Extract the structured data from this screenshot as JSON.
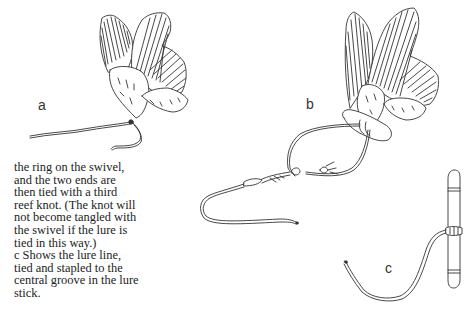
{
  "figure": {
    "panels": [
      {
        "id": "a",
        "label": "a",
        "description": "pair of wings tied together with lure line attached"
      },
      {
        "id": "b",
        "label": "b",
        "description": "wings tied to meat with line looped through swivel and reef knots"
      },
      {
        "id": "c",
        "label": "c",
        "description": "lure line tied and stapled to central groove of lure stick"
      }
    ]
  },
  "caption": {
    "lines": [
      "the ring on the swivel,",
      "and the two ends are",
      "then tied with a third",
      "reef knot. (The knot will",
      "not become tangled with",
      "the swivel if the lure is",
      "tied in this way.)",
      "c  Shows the lure line,",
      "tied and stapled to the",
      "central groove in the lure",
      "stick."
    ]
  },
  "colors": {
    "ink": "#333333",
    "paper": "#ffffff"
  }
}
